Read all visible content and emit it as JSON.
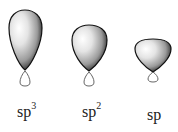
{
  "diagram": {
    "type": "hybrid-orbital-comparison",
    "orbitals": [
      {
        "name": "sp3",
        "label_base": "sp",
        "label_sup": "3",
        "big_lobe": {
          "cx": 25,
          "top": 10,
          "bottom": 70,
          "half_width": 16.5
        },
        "small_lobe": {
          "cx": 25,
          "top": 71,
          "bottom": 86,
          "half_width": 5
        },
        "label_pos": {
          "x": 17,
          "y": 104
        }
      },
      {
        "name": "sp2",
        "label_base": "sp",
        "label_sup": "2",
        "big_lobe": {
          "cx": 89,
          "top": 25,
          "bottom": 71,
          "half_width": 17.5
        },
        "small_lobe": {
          "cx": 89,
          "top": 72,
          "bottom": 86,
          "half_width": 5
        },
        "label_pos": {
          "x": 83,
          "y": 104
        }
      },
      {
        "name": "sp",
        "label_base": "sp",
        "label_sup": "",
        "big_lobe": {
          "cx": 153,
          "top": 39,
          "bottom": 72,
          "half_width": 18
        },
        "small_lobe": {
          "cx": 153,
          "top": 72,
          "bottom": 82,
          "half_width": 5
        },
        "label_pos": {
          "x": 147,
          "y": 107
        }
      }
    ],
    "colors": {
      "lobe_highlight": "#ffffff",
      "lobe_mid": "#b8b8b8",
      "lobe_shadow": "#1a1a1a",
      "outline": "#111111",
      "small_lobe_stroke": "#555555"
    }
  }
}
